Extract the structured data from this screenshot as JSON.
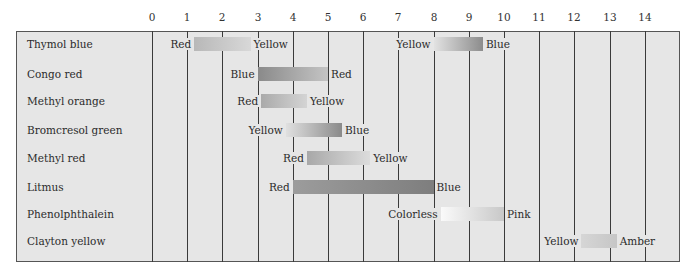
{
  "chart_data": {
    "type": "range-bar",
    "title": "",
    "xlabel": "pH",
    "ylabel": "",
    "xlim": [
      0,
      14
    ],
    "x_ticks": [
      0,
      1,
      2,
      3,
      4,
      5,
      6,
      7,
      8,
      9,
      10,
      11,
      12,
      13,
      14
    ],
    "grid": true,
    "legend": "none",
    "indicators": [
      {
        "name": "Thymol blue",
        "ranges": [
          {
            "low": 1.2,
            "high": 2.8,
            "low_color": "Red",
            "high_color": "Yellow",
            "grad": [
              "#b8b8b8",
              "#d8d8d8"
            ]
          },
          {
            "low": 8.0,
            "high": 9.4,
            "low_color": "Yellow",
            "high_color": "Blue",
            "grad": [
              "#e2e2e2",
              "#8c8c8c"
            ]
          }
        ]
      },
      {
        "name": "Congo red",
        "ranges": [
          {
            "low": 3.0,
            "high": 5.0,
            "low_color": "Blue",
            "high_color": "Red",
            "grad": [
              "#8a8a8a",
              "#c4c4c4"
            ]
          }
        ]
      },
      {
        "name": "Methyl orange",
        "ranges": [
          {
            "low": 3.1,
            "high": 4.4,
            "low_color": "Red",
            "high_color": "Yellow",
            "grad": [
              "#aaaaaa",
              "#d4d4d4"
            ]
          }
        ]
      },
      {
        "name": "Bromcresol green",
        "ranges": [
          {
            "low": 3.8,
            "high": 5.4,
            "low_color": "Yellow",
            "high_color": "Blue",
            "grad": [
              "#e0e0e0",
              "#8a8a8a"
            ]
          }
        ]
      },
      {
        "name": "Methyl red",
        "ranges": [
          {
            "low": 4.4,
            "high": 6.2,
            "low_color": "Red",
            "high_color": "Yellow",
            "grad": [
              "#a8a8a8",
              "#dcdcdc"
            ]
          }
        ]
      },
      {
        "name": "Litmus",
        "ranges": [
          {
            "low": 4.0,
            "high": 8.0,
            "low_color": "Red",
            "high_color": "Blue",
            "grad": [
              "#9c9c9c",
              "#7e7e7e"
            ]
          }
        ]
      },
      {
        "name": "Phenolphthalein",
        "ranges": [
          {
            "low": 8.2,
            "high": 10.0,
            "low_color": "Colorless",
            "high_color": "Pink",
            "grad": [
              "#fafafa",
              "#c8c8c8"
            ]
          }
        ]
      },
      {
        "name": "Clayton yellow",
        "ranges": [
          {
            "low": 12.2,
            "high": 13.2,
            "low_color": "Yellow",
            "high_color": "Amber",
            "grad": [
              "#d6d6d6",
              "#c6c6c6"
            ]
          }
        ]
      }
    ]
  },
  "tick_labels": [
    "0",
    "1",
    "2",
    "3",
    "4",
    "5",
    "6",
    "7",
    "8",
    "9",
    "10",
    "11",
    "12",
    "13",
    "14"
  ],
  "row_labels": [
    "Thymol blue",
    "Congo red",
    "Methyl orange",
    "Bromcresol green",
    "Methyl red",
    "Litmus",
    "Phenolphthalein",
    "Clayton yellow"
  ]
}
